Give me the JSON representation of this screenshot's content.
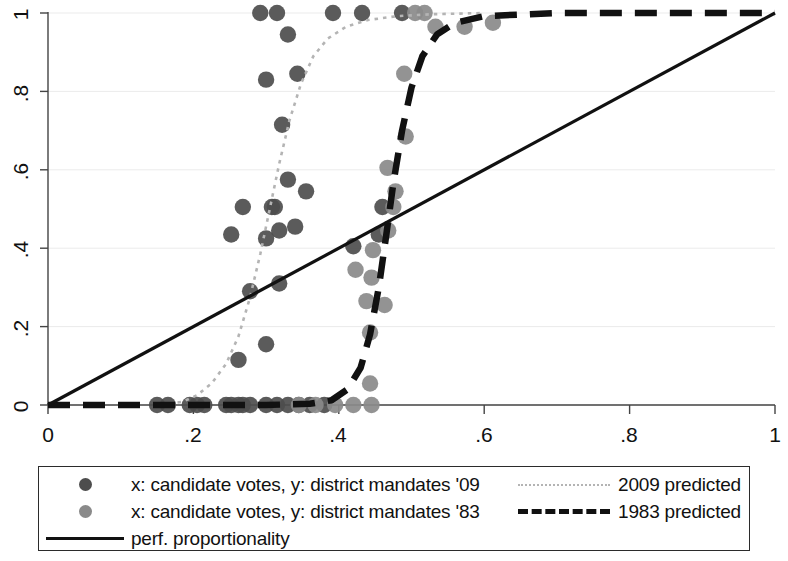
{
  "axes": {
    "x_ticks": [
      "0",
      ".2",
      ".4",
      ".6",
      ".8",
      "1"
    ],
    "y_ticks": [
      "0",
      ".2",
      ".4",
      ".6",
      ".8",
      "1"
    ],
    "xlabel": "",
    "ylabel": ""
  },
  "legend": {
    "scatter_2009_label": "x: candidate votes, y: district mandates '09",
    "scatter_1983_label": "x: candidate votes, y: district mandates '83",
    "perf_label": "perf. proportionality",
    "pred_2009_label": "2009 predicted",
    "pred_1983_label": "1983 predicted"
  },
  "colors": {
    "scatter_2009": "#4d4d4d",
    "scatter_1983": "#8a8a8a",
    "pred_2009": "#b4b4b4",
    "pred_1983": "#111111",
    "perf_line": "#111111",
    "grid": "#ebebeb",
    "axis": "#444444",
    "background": "#ffffff"
  },
  "chart_data": {
    "type": "scatter",
    "title": "",
    "xlabel": "candidate votes",
    "ylabel": "district mandates",
    "xlim": [
      0,
      1
    ],
    "ylim": [
      0,
      1
    ],
    "grid": true,
    "legend_position": "below",
    "x_ticks": [
      0,
      0.2,
      0.4,
      0.6,
      0.8,
      1
    ],
    "y_ticks": [
      0,
      0.2,
      0.4,
      0.6,
      0.8,
      1
    ],
    "series": [
      {
        "name": "x: candidate votes, y: district mandates '09",
        "type": "scatter",
        "color": "#4d4d4d",
        "points": [
          [
            0.15,
            0.0
          ],
          [
            0.165,
            0.0
          ],
          [
            0.195,
            0.0
          ],
          [
            0.205,
            0.0
          ],
          [
            0.215,
            0.0
          ],
          [
            0.245,
            0.0
          ],
          [
            0.252,
            0.0
          ],
          [
            0.262,
            0.0
          ],
          [
            0.268,
            0.0
          ],
          [
            0.278,
            0.0
          ],
          [
            0.3,
            0.0
          ],
          [
            0.315,
            0.0
          ],
          [
            0.33,
            0.0
          ],
          [
            0.345,
            0.0
          ],
          [
            0.36,
            0.0
          ],
          [
            0.38,
            0.0
          ],
          [
            0.262,
            0.115
          ],
          [
            0.3,
            0.155
          ],
          [
            0.278,
            0.29
          ],
          [
            0.318,
            0.31
          ],
          [
            0.252,
            0.435
          ],
          [
            0.3,
            0.425
          ],
          [
            0.318,
            0.445
          ],
          [
            0.34,
            0.455
          ],
          [
            0.268,
            0.505
          ],
          [
            0.308,
            0.505
          ],
          [
            0.312,
            0.505
          ],
          [
            0.33,
            0.575
          ],
          [
            0.355,
            0.545
          ],
          [
            0.322,
            0.715
          ],
          [
            0.3,
            0.83
          ],
          [
            0.343,
            0.845
          ],
          [
            0.33,
            0.945
          ],
          [
            0.292,
            1.0
          ],
          [
            0.315,
            1.0
          ],
          [
            0.392,
            1.0
          ],
          [
            0.432,
            1.0
          ],
          [
            0.42,
            0.405
          ],
          [
            0.455,
            0.435
          ],
          [
            0.46,
            0.505
          ],
          [
            0.487,
            1.0
          ]
        ]
      },
      {
        "name": "x: candidate votes, y: district mandates '83",
        "type": "scatter",
        "color": "#8a8a8a",
        "points": [
          [
            0.345,
            0.0
          ],
          [
            0.395,
            0.0
          ],
          [
            0.42,
            0.0
          ],
          [
            0.445,
            0.0
          ],
          [
            0.368,
            0.0
          ],
          [
            0.443,
            0.055
          ],
          [
            0.443,
            0.185
          ],
          [
            0.438,
            0.265
          ],
          [
            0.463,
            0.255
          ],
          [
            0.445,
            0.325
          ],
          [
            0.447,
            0.395
          ],
          [
            0.423,
            0.345
          ],
          [
            0.468,
            0.445
          ],
          [
            0.475,
            0.505
          ],
          [
            0.478,
            0.545
          ],
          [
            0.467,
            0.605
          ],
          [
            0.492,
            0.685
          ],
          [
            0.49,
            0.845
          ],
          [
            0.505,
            1.0
          ],
          [
            0.518,
            1.0
          ],
          [
            0.533,
            0.965
          ],
          [
            0.573,
            0.965
          ],
          [
            0.612,
            0.975
          ]
        ]
      },
      {
        "name": "2009 predicted",
        "type": "line",
        "style": "dotted",
        "color": "#b4b4b4",
        "points": [
          [
            0.155,
            0.0
          ],
          [
            0.185,
            0.008
          ],
          [
            0.205,
            0.025
          ],
          [
            0.225,
            0.055
          ],
          [
            0.245,
            0.105
          ],
          [
            0.262,
            0.175
          ],
          [
            0.278,
            0.275
          ],
          [
            0.292,
            0.385
          ],
          [
            0.305,
            0.5
          ],
          [
            0.318,
            0.615
          ],
          [
            0.332,
            0.725
          ],
          [
            0.348,
            0.82
          ],
          [
            0.365,
            0.89
          ],
          [
            0.385,
            0.935
          ],
          [
            0.41,
            0.965
          ],
          [
            0.44,
            0.982
          ],
          [
            0.48,
            0.992
          ],
          [
            0.53,
            0.997
          ],
          [
            0.6,
            1.0
          ]
        ]
      },
      {
        "name": "1983 predicted",
        "type": "line",
        "style": "dashed",
        "color": "#111111",
        "points": [
          [
            0.0,
            0.0
          ],
          [
            0.3,
            0.0
          ],
          [
            0.36,
            0.003
          ],
          [
            0.39,
            0.012
          ],
          [
            0.412,
            0.04
          ],
          [
            0.43,
            0.095
          ],
          [
            0.443,
            0.18
          ],
          [
            0.455,
            0.3
          ],
          [
            0.465,
            0.43
          ],
          [
            0.475,
            0.565
          ],
          [
            0.487,
            0.7
          ],
          [
            0.5,
            0.81
          ],
          [
            0.515,
            0.89
          ],
          [
            0.535,
            0.945
          ],
          [
            0.56,
            0.975
          ],
          [
            0.6,
            0.992
          ],
          [
            0.7,
            1.0
          ],
          [
            1.0,
            1.0
          ]
        ]
      },
      {
        "name": "perf. proportionality",
        "type": "line",
        "style": "solid",
        "color": "#111111",
        "points": [
          [
            0.0,
            0.0
          ],
          [
            1.0,
            1.0
          ]
        ]
      }
    ]
  }
}
